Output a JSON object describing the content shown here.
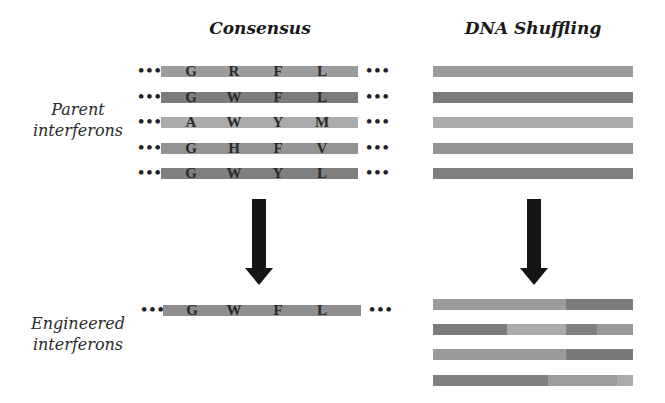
{
  "headings": {
    "consensus": "Consensus",
    "shuffling": "DNA Shuffling"
  },
  "labels": {
    "parent_line1": "Parent",
    "parent_line2": "interferons",
    "engineered_line1": "Engineered",
    "engineered_line2": "interferons"
  },
  "ellipsis": "•••",
  "consensus_parents": [
    {
      "residues": [
        "G",
        "R",
        "F",
        "L"
      ],
      "color": "#9c9c9c"
    },
    {
      "residues": [
        "G",
        "W",
        "F",
        "L"
      ],
      "color": "#7c7c7c"
    },
    {
      "residues": [
        "A",
        "W",
        "Y",
        "M"
      ],
      "color": "#ababab"
    },
    {
      "residues": [
        "G",
        "H",
        "F",
        "V"
      ],
      "color": "#939393"
    },
    {
      "residues": [
        "G",
        "W",
        "Y",
        "L"
      ],
      "color": "#7f7f7f"
    }
  ],
  "consensus_engineered": {
    "residues": [
      "G",
      "W",
      "F",
      "L"
    ],
    "color": "#8e8e8e"
  },
  "shuffling_parents": [
    {
      "color": "#9c9c9c"
    },
    {
      "color": "#7c7c7c"
    },
    {
      "color": "#ababab"
    },
    {
      "color": "#939393"
    },
    {
      "color": "#7f7f7f"
    }
  ],
  "shuffling_engineered": [
    {
      "segments": [
        {
          "width": 133,
          "color": "#9c9c9c"
        },
        {
          "width": 67,
          "color": "#7c7c7c"
        }
      ]
    },
    {
      "segments": [
        {
          "width": 74,
          "color": "#7c7c7c"
        },
        {
          "width": 59,
          "color": "#ababab"
        },
        {
          "width": 31,
          "color": "#808080"
        },
        {
          "width": 36,
          "color": "#999999"
        }
      ]
    },
    {
      "segments": [
        {
          "width": 133,
          "color": "#9a9a9a"
        },
        {
          "width": 67,
          "color": "#7a7a7a"
        }
      ]
    },
    {
      "segments": [
        {
          "width": 115,
          "color": "#808080"
        },
        {
          "width": 69,
          "color": "#9c9c9c"
        },
        {
          "width": 16,
          "color": "#ababab"
        }
      ]
    }
  ],
  "arrow_color": "#151515"
}
